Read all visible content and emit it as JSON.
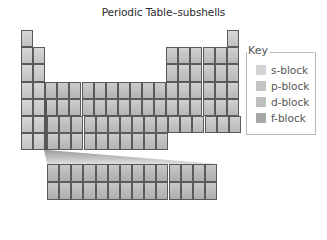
{
  "title": "Periodic Table–subshells",
  "key": {
    "title": "Key",
    "items": [
      {
        "label": "s-block",
        "color": "#d3d3d3"
      },
      {
        "label": "p-block",
        "color": "#c4c4c4"
      },
      {
        "label": "d-block",
        "color": "#bebebe"
      },
      {
        "label": "f-block",
        "color": "#a8a8a8"
      }
    ]
  },
  "table": {
    "main_columns": 18,
    "main_rows": 7,
    "f_block_columns": 14,
    "f_block_rows": 2
  },
  "colors": {
    "cell_border": "#5a5a5a",
    "f_marker": "#555555",
    "key_border": "#b8b8b8"
  }
}
